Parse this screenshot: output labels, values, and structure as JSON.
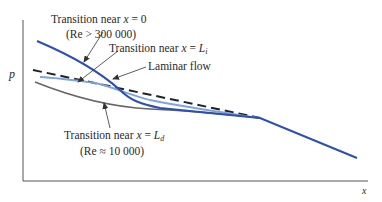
{
  "diagram": {
    "axes": {
      "y_label": "p",
      "x_label": "x"
    },
    "annotations": [
      {
        "id": "transition_x0",
        "text_prefix": "Transition near ",
        "var": "x",
        "eq": " = 0",
        "sub": "",
        "note": "(Re > 300 000)"
      },
      {
        "id": "transition_Li",
        "text_prefix": "Transition near ",
        "var": "x",
        "eq": " = ",
        "sym": "L",
        "sub": "i",
        "note": ""
      },
      {
        "id": "laminar",
        "text": "Laminar flow"
      },
      {
        "id": "transition_Ld",
        "text_prefix": "Transition near ",
        "var": "x",
        "eq": " = ",
        "sym": "L",
        "sub": "d",
        "note": "(Re ≈ 10 000)"
      }
    ],
    "curves": [
      {
        "name": "transition-near-x0",
        "color": "#2c4fb5",
        "style": "solid"
      },
      {
        "name": "transition-near-Li",
        "color": "#7da4dc",
        "style": "solid"
      },
      {
        "name": "laminar-flow",
        "color": "#222222",
        "style": "dashed"
      },
      {
        "name": "transition-near-Ld",
        "color": "#666666",
        "style": "solid"
      }
    ]
  }
}
